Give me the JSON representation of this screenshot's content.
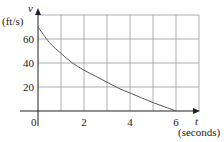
{
  "chart_data": {
    "type": "line",
    "title": "",
    "xlabel": "(seconds)",
    "xvar": "t",
    "ylabel": "(ft/s)",
    "yvar": "v",
    "xlim": [
      0,
      7
    ],
    "ylim": [
      0,
      80
    ],
    "x_grid_step": 1,
    "y_grid_step": 20,
    "grid": true,
    "x_ticks": [
      {
        "value": 2,
        "label": "2"
      },
      {
        "value": 4,
        "label": "4"
      },
      {
        "value": 6,
        "label": "6"
      }
    ],
    "y_ticks": [
      {
        "value": 20,
        "label": "20"
      },
      {
        "value": 40,
        "label": "40"
      },
      {
        "value": 60,
        "label": "60"
      }
    ],
    "origin_label": "0",
    "series": [
      {
        "name": "v(t)",
        "x": [
          0,
          0.5,
          1,
          1.5,
          2,
          2.5,
          3,
          3.5,
          4,
          4.5,
          5,
          5.5,
          6
        ],
        "y": [
          70,
          57,
          48,
          40,
          34,
          29,
          24,
          19,
          15,
          11,
          7,
          3.5,
          0
        ]
      }
    ]
  }
}
